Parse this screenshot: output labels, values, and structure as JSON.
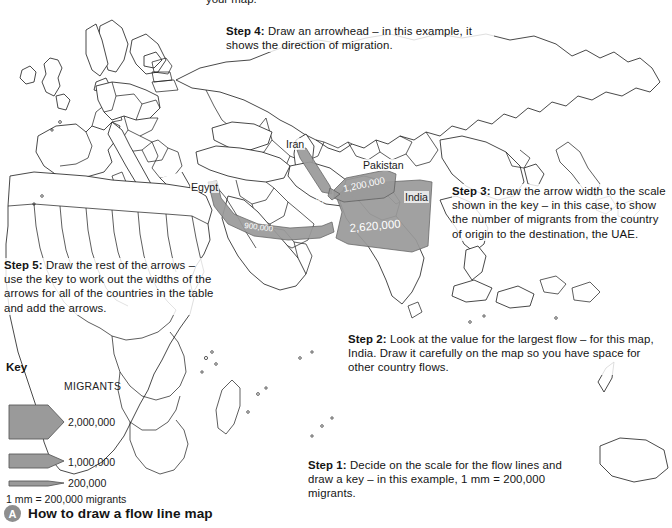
{
  "figure": {
    "caption_badge": "A",
    "caption_text": "How to draw a flow line map",
    "cut_top_text": "your map."
  },
  "steps": {
    "step1": "Step 1: Decide on the scale for the flow lines and draw a key – in this example, 1 mm = 200,000 migrants.",
    "step1_label": "Step 1:",
    "step1_body": " Decide on the scale for the flow lines and draw a key – in this example, 1 mm = 200,000 migrants.",
    "step2_label": "Step 2:",
    "step2_body": " Look at the value for the largest flow – for this map, India. Draw it carefully on the map so you have space for other country flows.",
    "step3_label": "Step 3:",
    "step3_body": " Draw the arrow width to the scale shown in the key – in this case, to show the number of migrants from the country of origin to the destination, the UAE.",
    "step4_label": "Step 4:",
    "step4_body": " Draw an arrowhead – in this example, it shows the direction of migration.",
    "step5_label": "Step 5:",
    "step5_body": " Draw the rest of the arrows – use the key to work out the widths of the arrows for all of the countries in the table and add the arrows."
  },
  "key": {
    "title": "Key",
    "column_header": "MIGRANTS",
    "entries": [
      {
        "value": "2,000,000",
        "width_mm": 10
      },
      {
        "value": "1,000,000",
        "width_mm": 5
      },
      {
        "value": "200,000",
        "width_mm": 1
      }
    ],
    "scale_note": "1 mm = 200,000 migrants"
  },
  "map": {
    "labels": {
      "egypt": "Egypt",
      "iran": "Iran",
      "pakistan": "Pakistan",
      "india": "India"
    },
    "destination": "UAE",
    "flows": [
      {
        "origin": "India",
        "value": "2,620,000"
      },
      {
        "origin": "Pakistan",
        "value": "1,200,000"
      },
      {
        "origin": "Iran",
        "value": "400,000"
      },
      {
        "origin": "Egypt",
        "value": "900,000"
      }
    ]
  },
  "colors": {
    "flow_fill": "#9a9a9a",
    "flow_stroke": "#5c5c5c",
    "coastline": "#1a1a1a",
    "badge": "#8e8e8e",
    "background": "#ffffff"
  }
}
